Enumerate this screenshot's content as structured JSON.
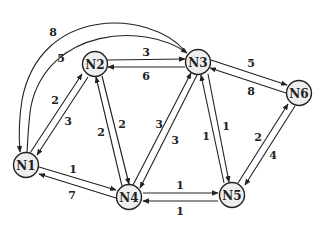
{
  "diagram": {
    "type": "directed-weighted-graph",
    "nodes": [
      {
        "id": "N1",
        "label": "N1",
        "x": 26,
        "y": 165
      },
      {
        "id": "N2",
        "label": "N2",
        "x": 95,
        "y": 64
      },
      {
        "id": "N3",
        "label": "N3",
        "x": 198,
        "y": 62
      },
      {
        "id": "N4",
        "label": "N4",
        "x": 129,
        "y": 197
      },
      {
        "id": "N5",
        "label": "N5",
        "x": 232,
        "y": 195
      },
      {
        "id": "N6",
        "label": "N6",
        "x": 299,
        "y": 93
      }
    ],
    "edges": [
      {
        "from": "N1",
        "to": "N2",
        "weight": "2"
      },
      {
        "from": "N2",
        "to": "N1",
        "weight": "3"
      },
      {
        "from": "N1",
        "to": "N3",
        "weight": "5"
      },
      {
        "from": "N3",
        "to": "N1",
        "weight": "8"
      },
      {
        "from": "N1",
        "to": "N4",
        "weight": "1"
      },
      {
        "from": "N4",
        "to": "N1",
        "weight": "7"
      },
      {
        "from": "N2",
        "to": "N3",
        "weight": "3"
      },
      {
        "from": "N3",
        "to": "N2",
        "weight": "6"
      },
      {
        "from": "N2",
        "to": "N4",
        "weight": "2"
      },
      {
        "from": "N4",
        "to": "N2",
        "weight": "2"
      },
      {
        "from": "N4",
        "to": "N3",
        "weight": "3"
      },
      {
        "from": "N3",
        "to": "N4",
        "weight": "3"
      },
      {
        "from": "N3",
        "to": "N5",
        "weight": "1"
      },
      {
        "from": "N5",
        "to": "N3",
        "weight": "1"
      },
      {
        "from": "N3",
        "to": "N6",
        "weight": "5"
      },
      {
        "from": "N6",
        "to": "N3",
        "weight": "8"
      },
      {
        "from": "N4",
        "to": "N5",
        "weight": "1"
      },
      {
        "from": "N5",
        "to": "N4",
        "weight": "1"
      },
      {
        "from": "N5",
        "to": "N6",
        "weight": "2"
      },
      {
        "from": "N6",
        "to": "N5",
        "weight": "4"
      }
    ]
  },
  "labels": {
    "n1": "N1",
    "n2": "N2",
    "n3": "N3",
    "n4": "N4",
    "n5": "N5",
    "n6": "N6",
    "w_n1_n2": "2",
    "w_n2_n1": "3",
    "w_n1_n3": "5",
    "w_n3_n1": "8",
    "w_n1_n4": "1",
    "w_n4_n1": "7",
    "w_n2_n3": "3",
    "w_n3_n2": "6",
    "w_n2_n4": "2",
    "w_n4_n2": "2",
    "w_n4_n3": "3",
    "w_n3_n4": "3",
    "w_n3_n5": "1",
    "w_n5_n3": "1",
    "w_n3_n6": "5",
    "w_n6_n3": "8",
    "w_n4_n5": "1",
    "w_n5_n4": "1",
    "w_n5_n6": "2",
    "w_n6_n5": "4"
  },
  "colors": {
    "node_fill": "#eeeeee",
    "stroke": "#222222",
    "background": "#ffffff"
  }
}
